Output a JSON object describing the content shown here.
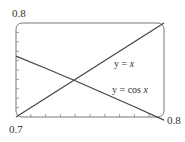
{
  "chart_data": {
    "type": "line",
    "title": "",
    "xlabel": "",
    "ylabel": "",
    "xlim": [
      0.7,
      0.8
    ],
    "ylim": [
      0.7,
      0.8
    ],
    "x_tick_labels": {
      "min": "0.7",
      "max": "0.8"
    },
    "y_tick_labels": {
      "max": "0.8"
    },
    "minor_ticks": {
      "x_count": 10,
      "y_count": 10
    },
    "grid": false,
    "legend": "inline annotations",
    "series": [
      {
        "name": "y = x",
        "function": "x",
        "x": [
          0.7,
          0.8
        ],
        "y": [
          0.7,
          0.8
        ]
      },
      {
        "name": "y = cos x",
        "function": "cos(x)",
        "x": [
          0.7,
          0.72,
          0.74,
          0.76,
          0.78,
          0.8
        ],
        "y": [
          0.7648,
          0.7518,
          0.7385,
          0.7248,
          0.7109,
          0.6967
        ]
      }
    ],
    "annotations": [
      {
        "text_prefix": "y = ",
        "text_var": "x",
        "label": "y = x"
      },
      {
        "text_prefix": "y = cos ",
        "text_var": "x",
        "label": "y = cos x"
      }
    ],
    "intersection": {
      "x": 0.739,
      "y": 0.739
    }
  }
}
